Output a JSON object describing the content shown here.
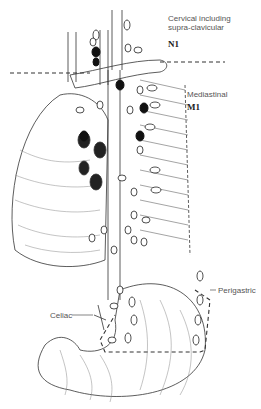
{
  "diagram": {
    "regions": [
      {
        "name": "Cervical including supra-clavicular",
        "line1": "Cervical including",
        "line2": "supra-clavicular",
        "code": "N1"
      },
      {
        "name": "Mediastinal",
        "label": "Mediastinal",
        "code": "M1"
      },
      {
        "name": "Perigastric",
        "label": "Perigastric"
      },
      {
        "name": "Celiac",
        "label": "Celiac"
      }
    ],
    "colors": {
      "ink": "#222222",
      "label": "#555555",
      "background": "#ffffff",
      "positive_node": "#111111"
    }
  }
}
